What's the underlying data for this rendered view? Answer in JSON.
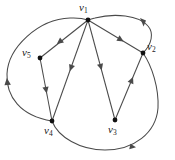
{
  "figure": {
    "type": "directed-graph-diagram",
    "background_color": "#ffffff",
    "stroke_color": "#4a4a4a",
    "node_color": "#111111",
    "label_color": "#1a1a1a",
    "width": 175,
    "height": 160
  },
  "nodes": [
    {
      "id": "v1",
      "label_main": "v",
      "label_sub": "1",
      "x": 88,
      "y": 20,
      "label_x": 80,
      "label_y": 3
    },
    {
      "id": "v2",
      "label_main": "v",
      "label_sub": "2",
      "x": 143,
      "y": 53,
      "label_x": 148,
      "label_y": 40
    },
    {
      "id": "v3",
      "label_main": "v",
      "label_sub": "3",
      "x": 115,
      "y": 120,
      "label_x": 108,
      "label_y": 125
    },
    {
      "id": "v4",
      "label_main": "v",
      "label_sub": "4",
      "x": 52,
      "y": 121,
      "label_x": 44,
      "label_y": 126
    },
    {
      "id": "v5",
      "label_main": "v",
      "label_sub": "5",
      "x": 40,
      "y": 58,
      "label_x": 23,
      "label_y": 48
    }
  ],
  "edges": [
    {
      "id": "e1",
      "from": "v1",
      "to": "v5",
      "style": "straight",
      "arrow_at": 0.5,
      "arrow_dir": "toward-v5"
    },
    {
      "id": "e2",
      "from": "v1",
      "to": "v4",
      "style": "straight",
      "arrow_at": 0.45,
      "arrow_dir": "toward-v4"
    },
    {
      "id": "e3",
      "from": "v1",
      "to": "v3",
      "style": "straight",
      "arrow_at": 0.45,
      "arrow_dir": "toward-v3"
    },
    {
      "id": "e4",
      "from": "v1",
      "to": "v2",
      "style": "straight",
      "arrow_at": 0.55,
      "arrow_dir": "toward-v2"
    },
    {
      "id": "e5",
      "from": "v5",
      "to": "v4",
      "style": "straight",
      "arrow_at": 0.5,
      "arrow_dir": "toward-v4"
    },
    {
      "id": "e6",
      "from": "v3",
      "to": "v2",
      "style": "straight",
      "arrow_at": 0.5,
      "arrow_dir": "toward-v2"
    },
    {
      "id": "e7",
      "from": "v4",
      "to": "v1",
      "style": "curved-left-outer",
      "arrow_at": 0.5,
      "arrow_dir": "upward"
    },
    {
      "id": "e8",
      "from": "v2",
      "to": "v1",
      "style": "curved-top-right",
      "arrow_at": 0.5,
      "arrow_dir": "toward-v1"
    },
    {
      "id": "e9",
      "from": "v4",
      "to": "v2",
      "style": "curved-bottom-right",
      "arrow_at": 0.72,
      "arrow_dir": "rightward"
    }
  ],
  "node_count": 5,
  "edge_count": 9
}
